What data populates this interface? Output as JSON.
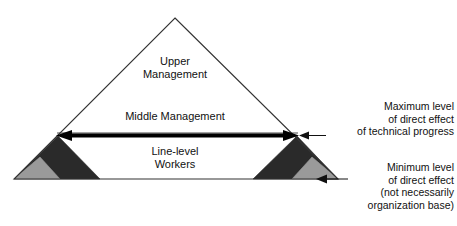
{
  "diagram": {
    "colors": {
      "outline": "#333333",
      "dark_fill": "#2a2a2a",
      "gray_fill": "#9a9a9a",
      "background": "#ffffff",
      "text": "#111111",
      "thick_line": "#000000"
    },
    "pyramid": {
      "levels": [
        {
          "id": "upper",
          "label": "Upper\nManagement"
        },
        {
          "id": "middle",
          "label": "Middle Management"
        },
        {
          "id": "line",
          "label": "Line-level\nWorkers"
        }
      ]
    },
    "callouts": [
      {
        "id": "maximum",
        "label": "Maximum level\nof direct effect\nof technical progress"
      },
      {
        "id": "minimum",
        "label": "Minimum level\nof direct effect\n(not necessarily\norganization base)"
      }
    ]
  }
}
